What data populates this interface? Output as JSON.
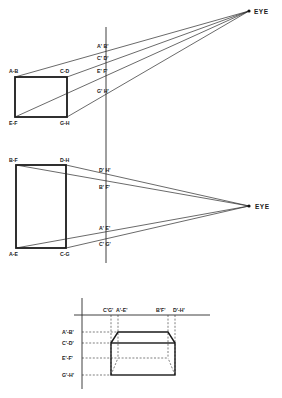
{
  "figure": {
    "eye_label": "EYE",
    "top_view": {
      "name": "Side elevation (viewer above)",
      "eye": {
        "label": "EYE",
        "x": 249,
        "y": 11
      },
      "picture_plane": {
        "x": 106,
        "y1": 27,
        "y2": 263
      },
      "object_corners": [
        {
          "label": "A-B",
          "x": 15,
          "y": 77
        },
        {
          "label": "C-D",
          "x": 67,
          "y": 77
        },
        {
          "label": "E-F",
          "x": 15,
          "y": 117
        },
        {
          "label": "G-H",
          "x": 67,
          "y": 117
        }
      ],
      "projected_points": [
        {
          "label": "A' B'",
          "y": 45
        },
        {
          "label": "C' D'",
          "y": 58
        },
        {
          "label": "E' F'",
          "y": 72
        },
        {
          "label": "G' H'",
          "y": 92
        }
      ]
    },
    "middle_view": {
      "name": "Plan view",
      "eye": {
        "label": "EYE",
        "x": 249,
        "y": 206
      },
      "object_corners": [
        {
          "label": "B-F",
          "x": 16,
          "y": 165
        },
        {
          "label": "D-H",
          "x": 66,
          "y": 165
        },
        {
          "label": "A-E",
          "x": 16,
          "y": 248
        },
        {
          "label": "C-G",
          "x": 66,
          "y": 248
        }
      ],
      "projected_points": [
        {
          "label": "D' H'",
          "y": 170
        },
        {
          "label": "B' F'",
          "y": 186
        },
        {
          "label": "A' E'",
          "y": 228
        },
        {
          "label": "C' G'",
          "y": 243
        }
      ]
    },
    "bottom_view": {
      "name": "Resulting perspective image",
      "column_labels": [
        {
          "label": "C'G'",
          "x": 111
        },
        {
          "label": "A'-E'",
          "x": 118
        },
        {
          "label": "B'F'",
          "x": 168
        },
        {
          "label": "D'-H'",
          "x": 175
        }
      ],
      "row_labels": [
        {
          "label": "A'-B'",
          "y": 332
        },
        {
          "label": "C'-D'",
          "y": 343
        },
        {
          "label": "E'-F'",
          "y": 358
        },
        {
          "label": "G'-H'",
          "y": 375
        }
      ]
    }
  }
}
